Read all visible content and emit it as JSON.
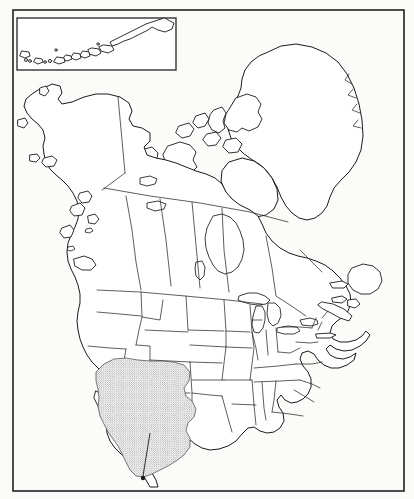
{
  "figure": {
    "type": "distribution-map",
    "region": "North America",
    "projection": "conic",
    "background_color": "#fbfbf9",
    "line_color": "#1a1a1a",
    "land_fill": "#ffffff",
    "frame": {
      "x": 13,
      "y": 10,
      "width": 391,
      "height": 481,
      "stroke_width": 1.6
    },
    "inset": {
      "name": "aleutian-islands-inset",
      "x": 17,
      "y": 18,
      "width": 159,
      "height": 52,
      "description": "Aleutian Islands chain shown in a rectangular inset box at upper left"
    },
    "range_overlay": {
      "name": "stippled-range",
      "style": "stipple",
      "dot_color": "#555555",
      "dot_spacing_px": 2.2,
      "dot_radius_px": 0.45,
      "coverage_label": "Southwestern United States and northern Mexico",
      "approx_bounds": {
        "x": 88,
        "y": 358,
        "width": 96,
        "height": 120
      }
    },
    "pointer": {
      "name": "locality-pointer",
      "from_x": 150,
      "from_y": 433,
      "to_x": 143,
      "to_y": 478,
      "dot_radius": 2.2,
      "description": "Leader line with filled dot marking a locality in northern Mexico"
    },
    "features": [
      {
        "name": "greenland",
        "label": "Greenland"
      },
      {
        "name": "canadian-arctic-archipelago",
        "label": "Canadian Arctic Archipelago"
      },
      {
        "name": "hudson-bay",
        "label": "Hudson Bay"
      },
      {
        "name": "great-lakes",
        "label": "Great Lakes"
      },
      {
        "name": "baja-california",
        "label": "Baja California"
      },
      {
        "name": "florida-peninsula",
        "label": "Florida"
      },
      {
        "name": "newfoundland",
        "label": "Newfoundland"
      },
      {
        "name": "alaska",
        "label": "Alaska"
      },
      {
        "name": "aleutian-islands",
        "label": "Aleutian Islands"
      },
      {
        "name": "state-province-boundaries",
        "label": "State and province boundaries"
      }
    ]
  }
}
